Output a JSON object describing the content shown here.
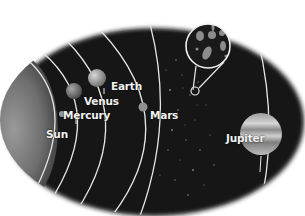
{
  "diagram": {
    "colors": {
      "background": "#ffffff",
      "space": "#161616",
      "orbit": "#e6e6e6",
      "label": "#f2f2f2"
    },
    "bodies": [
      {
        "id": "sun",
        "label": "Sun"
      },
      {
        "id": "mercury",
        "label": "Mercury"
      },
      {
        "id": "venus",
        "label": "Venus"
      },
      {
        "id": "earth",
        "label": "Earth"
      },
      {
        "id": "mars",
        "label": "Mars"
      },
      {
        "id": "asteroid-belt",
        "label": ""
      },
      {
        "id": "jupiter",
        "label": "Jupiter"
      }
    ]
  }
}
